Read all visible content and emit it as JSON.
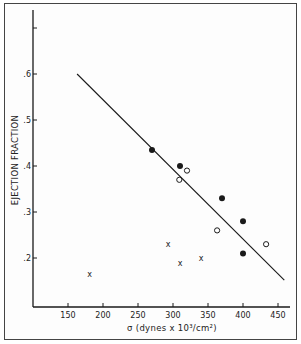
{
  "chart_data": {
    "type": "scatter",
    "title": "",
    "xlabel": "σ (dynes x 10³/cm²)",
    "ylabel": "EJECTION FRACTION",
    "xlim": [
      100,
      475
    ],
    "ylim": [
      0.1,
      0.75
    ],
    "x_ticks": [
      150,
      200,
      250,
      300,
      350,
      400,
      450
    ],
    "x_tick_labels": [
      "150",
      "200",
      "250",
      "300",
      "350",
      "400",
      "450"
    ],
    "y_ticks": [
      0.2,
      0.3,
      0.4,
      0.5,
      0.6,
      0.7
    ],
    "y_tick_labels": [
      ".2",
      ".3",
      ".4",
      ".5",
      ".6",
      ""
    ],
    "grid": false,
    "legend": null,
    "series": [
      {
        "name": "filled circles",
        "marker": "filled-circle",
        "points": [
          {
            "x": 270,
            "y": 0.435
          },
          {
            "x": 310,
            "y": 0.4
          },
          {
            "x": 370,
            "y": 0.33
          },
          {
            "x": 400,
            "y": 0.28
          },
          {
            "x": 400,
            "y": 0.21
          }
        ]
      },
      {
        "name": "open circles",
        "marker": "open-circle",
        "points": [
          {
            "x": 320,
            "y": 0.39
          },
          {
            "x": 309,
            "y": 0.37
          },
          {
            "x": 363,
            "y": 0.26
          },
          {
            "x": 433,
            "y": 0.23
          }
        ]
      },
      {
        "name": "crosses",
        "marker": "x",
        "points": [
          {
            "x": 181,
            "y": 0.165
          },
          {
            "x": 293,
            "y": 0.23
          },
          {
            "x": 310,
            "y": 0.19
          },
          {
            "x": 340,
            "y": 0.2
          }
        ]
      }
    ],
    "regression_line": {
      "x1": 163,
      "y1": 0.6,
      "x2": 459,
      "y2": 0.152
    }
  }
}
